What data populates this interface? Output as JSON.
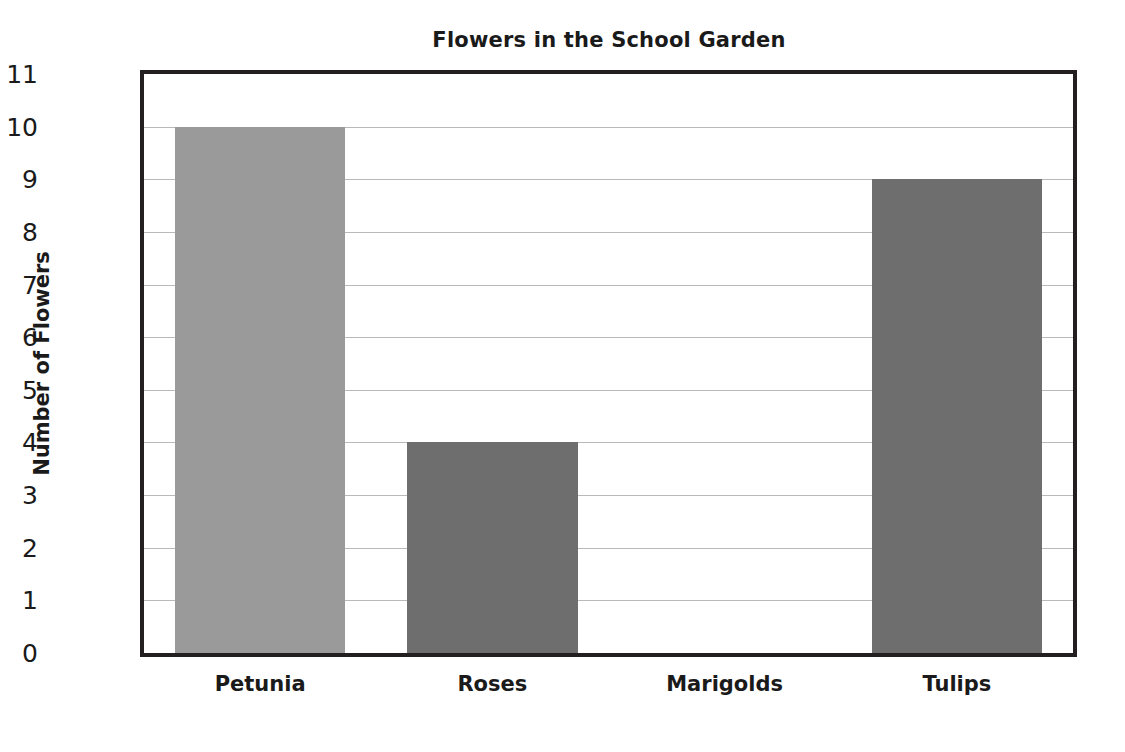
{
  "chart_data": {
    "type": "bar",
    "title": "Flowers in the School Garden",
    "xlabel": "",
    "ylabel": "Number of Flowers",
    "categories": [
      "Petunia",
      "Roses",
      "Marigolds",
      "Tulips"
    ],
    "values": [
      10,
      4,
      0,
      9
    ],
    "bar_colors": [
      "#9a9a9a",
      "#6e6e6e",
      "#6e6e6e",
      "#6e6e6e"
    ],
    "ylim": [
      0,
      11
    ],
    "ytick_labels": [
      "0",
      "1",
      "2",
      "3",
      "4",
      "5",
      "6",
      "7",
      "8",
      "9",
      "10",
      "11"
    ],
    "ytick_values": [
      0,
      1,
      2,
      3,
      4,
      5,
      6,
      7,
      8,
      9,
      10,
      11
    ],
    "grid": true,
    "grid_axis": "y",
    "grid_color": "#b9b9b9",
    "legend": false,
    "legend_position": "none",
    "plot_border_color": "#231f20",
    "background_color": "#ffffff",
    "text_color": "#1a1a1a"
  }
}
